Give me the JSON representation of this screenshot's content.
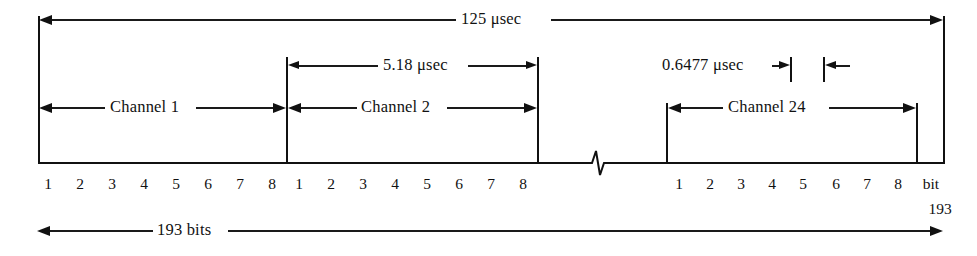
{
  "figure": {
    "type": "timing-diagram"
  },
  "dimensions": {
    "frame_duration": "125 μsec",
    "two_channel_duration": "5.18 μsec",
    "bit_duration": "0.6477 μsec",
    "frame_bits": "193 bits"
  },
  "channels": [
    {
      "label": "Channel 1",
      "bits": [
        "1",
        "2",
        "3",
        "4",
        "5",
        "6",
        "7",
        "8"
      ]
    },
    {
      "label": "Channel 2",
      "bits": [
        "1",
        "2",
        "3",
        "4",
        "5",
        "6",
        "7",
        "8"
      ]
    },
    {
      "label": "Channel 24",
      "bits": [
        "1",
        "2",
        "3",
        "4",
        "5",
        "6",
        "7",
        "8"
      ]
    }
  ],
  "framing_bit": {
    "label_line1": "bit",
    "label_line2": "193"
  },
  "colors": {
    "ink": "#111111",
    "background": "#ffffff"
  }
}
